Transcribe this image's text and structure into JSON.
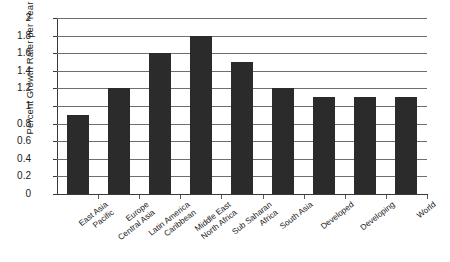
{
  "chart_data": {
    "type": "bar",
    "title": "",
    "xlabel": "",
    "ylabel": "Percent Growth Rater per Year",
    "ylim": [
      0,
      2
    ],
    "ytick_labels": [
      "2",
      "1.8",
      "1.6",
      "1.4",
      "1.2",
      "1",
      "0.8",
      "0.6",
      "0.4",
      "0.2",
      "0"
    ],
    "ytick_values": [
      2,
      1.8,
      1.6,
      1.4,
      1.2,
      1,
      0.8,
      0.6,
      0.4,
      0.2,
      0
    ],
    "grid": true,
    "legend": "none",
    "categories": [
      "East Asia Pacific",
      "Europe Central Asia",
      "Latin America Caribbean",
      "Middle East North Africa",
      "Sub Saharan Africa",
      "South Asia",
      "Developed",
      "Developing",
      "World"
    ],
    "category_lines": [
      [
        "East Asia",
        "Pacific"
      ],
      [
        "Europe",
        "Central Asia"
      ],
      [
        "Latin America",
        "Caribbean"
      ],
      [
        "Middle East",
        "North Africa"
      ],
      [
        "Sub Saharan",
        "Africa"
      ],
      [
        "South Asia",
        ""
      ],
      [
        "Developed",
        ""
      ],
      [
        "Developing",
        ""
      ],
      [
        "World",
        ""
      ]
    ],
    "values": [
      0.9,
      1.2,
      1.6,
      1.8,
      1.5,
      1.2,
      1.1,
      1.1,
      1.1
    ],
    "bar_color": "#2b2b2b",
    "gridline_color": "#6e6e6e",
    "axis_color": "#3a3a3a",
    "background_color": "#ffffff"
  }
}
